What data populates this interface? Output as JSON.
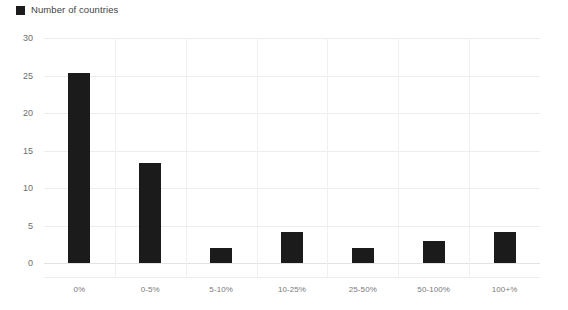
{
  "legend": {
    "marker_icon": "legend-square-icon",
    "label": "Number of countries",
    "color": "#1c1c1c",
    "position": "top-left"
  },
  "chart_data": {
    "type": "bar",
    "title": "",
    "subtitle": "",
    "xlabel": "",
    "ylabel": "",
    "categories": [
      "0%",
      "0-5%",
      "5-10%",
      "10-25%",
      "25-50%",
      "50-100%",
      "100+%"
    ],
    "series": [
      {
        "name": "Number of countries",
        "color": "#1b1b1b",
        "values": [
          25.4,
          13.4,
          2,
          4.2,
          2,
          3,
          4.2
        ]
      }
    ],
    "ylim": [
      0,
      30
    ],
    "yticks": [
      0,
      5,
      10,
      15,
      20,
      25,
      30
    ],
    "ytick_labels": [
      "0",
      "5",
      "10",
      "15",
      "20",
      "25",
      "30"
    ],
    "xlim_bands": 7,
    "grid": "horizontal",
    "legend_position": "top-left",
    "bar_color": "#1b1b1b",
    "gridline_color": "#ededed",
    "axis_label_color": "#7a7a7a",
    "background": "#ffffff"
  }
}
